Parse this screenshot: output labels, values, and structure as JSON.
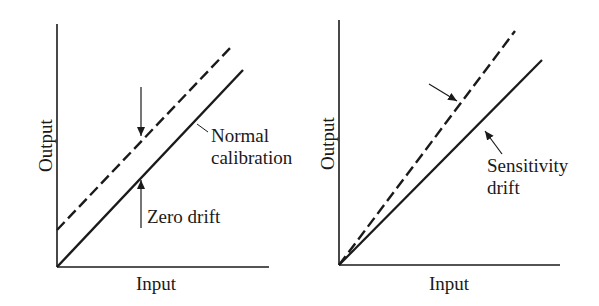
{
  "diagrams": [
    {
      "id": "zero-drift",
      "axes": {
        "xlabel": "Input",
        "ylabel": "Output"
      },
      "lines": [
        {
          "name": "Normal calibration",
          "style": "solid",
          "x1": 57,
          "y1": 267,
          "x2": 243,
          "y2": 70
        },
        {
          "name": "Zero drift",
          "style": "dashed",
          "x1": 57,
          "y1": 230,
          "x2": 232,
          "y2": 46
        }
      ],
      "labels": {
        "normal_line1": "Normal",
        "normal_line2": "calibration",
        "zero_drift": "Zero drift"
      }
    },
    {
      "id": "sensitivity-drift",
      "axes": {
        "xlabel": "Input",
        "ylabel": "Output"
      },
      "lines": [
        {
          "name": "Normal calibration",
          "style": "solid",
          "x1": 339,
          "y1": 265,
          "x2": 542,
          "y2": 60
        },
        {
          "name": "Sensitivity drift",
          "style": "dashed",
          "x1": 339,
          "y1": 265,
          "x2": 515,
          "y2": 31
        }
      ],
      "labels": {
        "sensitivity_line1": "Sensitivity",
        "sensitivity_line2": "drift"
      }
    }
  ],
  "colors": {
    "ink": "#1a1a1a",
    "background": "#ffffff"
  }
}
